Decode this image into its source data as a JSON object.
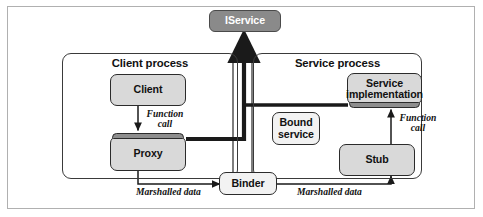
{
  "figure": {
    "colors": {
      "frame_border": "#b0b0b0",
      "process_border": "#3a3a3a",
      "box_fill": "#d9d9d9",
      "box_light_fill": "#f2f2f2",
      "box_dark_fill": "#8a8a8a",
      "strip_fill": "#8e8e8e",
      "line": "#1a1a1a",
      "text": "#111111"
    }
  },
  "nodes": {
    "iservice": {
      "label": "IService"
    },
    "client_process": {
      "title": "Client process"
    },
    "client": {
      "label": "Client"
    },
    "proxy": {
      "label": "Proxy"
    },
    "service_process": {
      "title": "Service process"
    },
    "service_implementation": {
      "label": "Service\nimplementation",
      "line1": "Service",
      "line2": "implementation"
    },
    "bound_service": {
      "label": "Bound service",
      "line1": "Bound",
      "line2": "service"
    },
    "stub": {
      "label": "Stub"
    },
    "binder": {
      "label": "Binder"
    }
  },
  "edges": {
    "client_to_proxy": {
      "label": "Function call",
      "line1": "Function",
      "line2": "call"
    },
    "stub_to_service_impl": {
      "label": "Function call",
      "line1": "Function",
      "line2": "call"
    },
    "proxy_to_binder": {
      "label": "Marshalled data"
    },
    "binder_to_stub": {
      "label": "Marshalled data"
    }
  }
}
